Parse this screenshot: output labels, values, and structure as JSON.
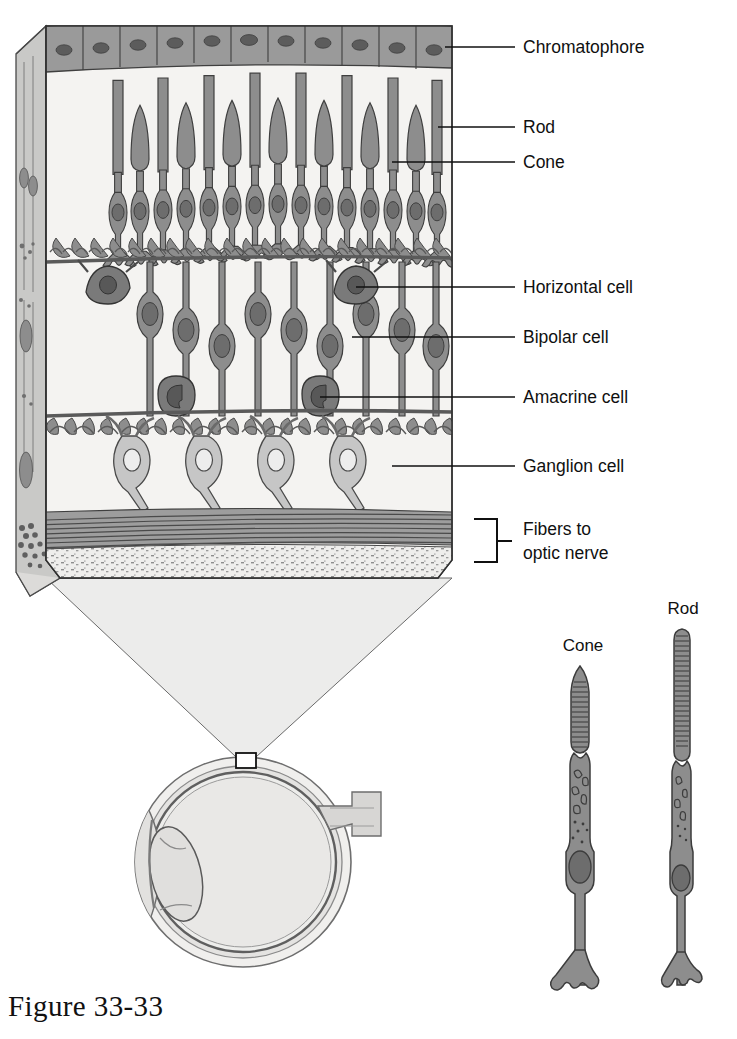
{
  "figure": {
    "caption": "Figure 33-33"
  },
  "labels": {
    "chromatophore": "Chromatophore",
    "rod": "Rod",
    "cone": "Cone",
    "horizontal_cell": "Horizontal cell",
    "bipolar_cell": "Bipolar cell",
    "amacrine_cell": "Amacrine cell",
    "ganglion_cell": "Ganglion cell",
    "fibers_line1": "Fibers to",
    "fibers_line2": "optic nerve"
  },
  "detail_labels": {
    "cone": "Cone",
    "rod": "Rod"
  },
  "colors": {
    "ink": "#101010",
    "cell_fill": "#8d8d8d",
    "cell_fill_light": "#b9b9b9",
    "nucleus": "#6d6d6d",
    "nucleus_dark": "#5a5a5a",
    "background": "#ffffff",
    "layer_bg": "#f4f3f1",
    "side_face": "#c9c9c7",
    "funnel": "#ececeb",
    "pigment_fill": "#9a9a9a",
    "ganglion_fill": "#c6c6c6",
    "eye_fill": "#ececec",
    "eye_rim": "#d2d2d2"
  },
  "layout": {
    "block": {
      "left": 46,
      "right": 452,
      "top": 20,
      "bottom": 585
    },
    "label_x": 523,
    "leader_end_x": 515
  },
  "leaders": [
    {
      "name": "chromatophore",
      "x1": 445,
      "y1": 47,
      "x2": 515,
      "y2": 47,
      "text_y": 53,
      "label": "Chromatophore"
    },
    {
      "name": "rod",
      "x1": 438,
      "y1": 127,
      "x2": 515,
      "y2": 127,
      "text_y": 133,
      "label": "Rod"
    },
    {
      "name": "cone",
      "x1": 392,
      "y1": 162,
      "x2": 515,
      "y2": 162,
      "text_y": 168,
      "label": "Cone"
    },
    {
      "name": "horizontal",
      "x1": 356,
      "y1": 287,
      "x2": 515,
      "y2": 287,
      "text_y": 293,
      "label": "Horizontal cell"
    },
    {
      "name": "bipolar",
      "x1": 352,
      "y1": 337,
      "x2": 515,
      "y2": 337,
      "text_y": 343,
      "label": "Bipolar cell"
    },
    {
      "name": "amacrine",
      "x1": 320,
      "y1": 397,
      "x2": 515,
      "y2": 397,
      "text_y": 403,
      "label": "Amacrine cell"
    },
    {
      "name": "ganglion",
      "x1": 392,
      "y1": 466,
      "x2": 515,
      "y2": 466,
      "text_y": 472,
      "label": "Ganglion cell"
    }
  ],
  "retina_layers": [
    {
      "name": "pigment-epithelium",
      "y_top": 26,
      "y_bottom": 68,
      "cells": 11
    },
    {
      "name": "photoreceptor-outer-segments",
      "y_top": 68,
      "y_bottom": 170
    },
    {
      "name": "outer-nuclear-layer",
      "y_top": 170,
      "y_bottom": 232
    },
    {
      "name": "outer-plexiform-layer",
      "y_top": 232,
      "y_bottom": 262
    },
    {
      "name": "inner-nuclear-layer",
      "y_top": 262,
      "y_bottom": 400
    },
    {
      "name": "inner-plexiform-layer",
      "y_top": 400,
      "y_bottom": 432
    },
    {
      "name": "ganglion-cell-layer",
      "y_top": 432,
      "y_bottom": 510
    },
    {
      "name": "nerve-fiber-layer",
      "y_top": 512,
      "y_bottom": 545
    },
    {
      "name": "inner-limiting-layer",
      "y_top": 545,
      "y_bottom": 578
    }
  ],
  "photoreceptor_columns": [
    {
      "x": 118,
      "type": "rod"
    },
    {
      "x": 140,
      "type": "cone"
    },
    {
      "x": 163,
      "type": "rod"
    },
    {
      "x": 186,
      "type": "cone"
    },
    {
      "x": 209,
      "type": "rod"
    },
    {
      "x": 232,
      "type": "cone"
    },
    {
      "x": 255,
      "type": "rod"
    },
    {
      "x": 278,
      "type": "cone"
    },
    {
      "x": 301,
      "type": "rod"
    },
    {
      "x": 324,
      "type": "cone"
    },
    {
      "x": 347,
      "type": "rod"
    },
    {
      "x": 370,
      "type": "cone"
    },
    {
      "x": 393,
      "type": "rod"
    },
    {
      "x": 416,
      "type": "cone"
    },
    {
      "x": 437,
      "type": "rod"
    }
  ],
  "bipolar_cells_x": [
    150,
    186,
    222,
    258,
    294,
    330,
    366,
    402,
    436
  ],
  "horizontal_cells_x": [
    108,
    356
  ],
  "amacrine_cells_x": [
    176,
    320
  ],
  "ganglion_cells_x": [
    132,
    204,
    276,
    348
  ],
  "nerve_fiber_lines": 7,
  "detail_cells": [
    {
      "name": "cone-photoreceptor",
      "label": "Cone",
      "label_x": 583,
      "label_y": 651,
      "cx": 580,
      "top": 665,
      "bottom": 985,
      "outer_segment": "tapered",
      "disc_count": 16
    },
    {
      "name": "rod-photoreceptor",
      "label": "Rod",
      "label_x": 683,
      "label_y": 614,
      "cx": 682,
      "top": 628,
      "bottom": 985,
      "outer_segment": "cylindrical",
      "disc_count": 20
    }
  ],
  "eye": {
    "name": "eyeball-cross-section",
    "cx": 243,
    "cy": 862,
    "rx": 108,
    "ry": 105,
    "inset_box": {
      "x": 236,
      "y": 753,
      "w": 20,
      "h": 15
    },
    "parts": [
      "sclera",
      "retina",
      "vitreous",
      "lens",
      "cornea",
      "optic-nerve"
    ]
  },
  "funnel": {
    "name": "magnification-funnel",
    "top_left_x": 46,
    "top_right_x": 452,
    "top_y": 578,
    "bottom_left_x": 236,
    "bottom_right_x": 256,
    "bottom_y": 757
  }
}
